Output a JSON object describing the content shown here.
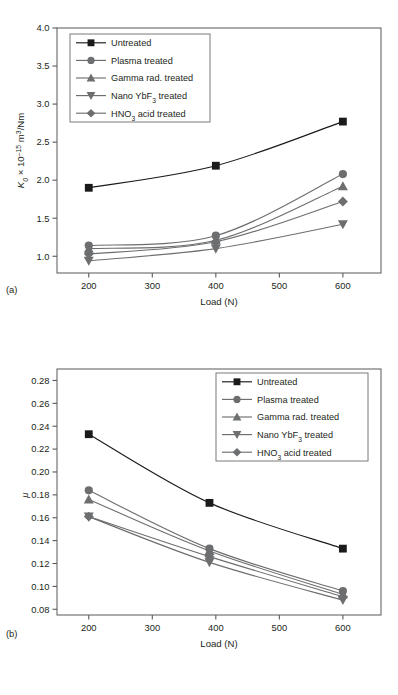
{
  "figure": {
    "panels": [
      {
        "letter": "(a)"
      },
      {
        "letter": "(b)"
      }
    ]
  },
  "legend": {
    "entries": [
      {
        "label": "Untreated",
        "marker": "square",
        "color": "#1a1a1a"
      },
      {
        "label": "Plasma treated",
        "marker": "circle",
        "color": "#6d6e70"
      },
      {
        "label": "Gamma rad. treated",
        "marker": "triangle-up",
        "color": "#6d6e70"
      },
      {
        "label": "Nano YbF3 treated",
        "marker": "triangle-down",
        "color": "#6d6e70"
      },
      {
        "label": "HNO3 acid treated",
        "marker": "diamond",
        "color": "#6d6e70"
      }
    ]
  },
  "chart_data": [
    {
      "type": "line",
      "panel": "(a)",
      "title": "",
      "xlabel": "Load (N)",
      "ylabel": "K0 × 10⁻¹⁵ m³/Nm",
      "x": [
        200,
        400,
        600
      ],
      "xlim": [
        150,
        660
      ],
      "ylim": [
        0.78,
        4.0
      ],
      "xticks": [
        200,
        300,
        400,
        500,
        600
      ],
      "xticklabels": [
        "200",
        "300",
        "400",
        "500",
        "600"
      ],
      "yticks": [
        1.0,
        1.5,
        2.0,
        2.5,
        3.0,
        3.5,
        4.0
      ],
      "yticklabels": [
        "1.0",
        "1.5",
        "2.0",
        "2.5",
        "3.0",
        "3.5",
        "4.0"
      ],
      "grid": false,
      "legend_position": "upper-left",
      "series": [
        {
          "name": "Untreated",
          "values": [
            1.9,
            2.19,
            2.77
          ],
          "marker": "square",
          "color": "#1a1a1a"
        },
        {
          "name": "Plasma treated",
          "values": [
            1.14,
            1.27,
            2.08
          ],
          "marker": "circle",
          "color": "#6d6e70"
        },
        {
          "name": "Gamma rad. treated",
          "values": [
            1.1,
            1.21,
            1.92
          ],
          "marker": "triangle-up",
          "color": "#6d6e70"
        },
        {
          "name": "Nano YbF3 treated",
          "values": [
            0.94,
            1.1,
            1.42
          ],
          "marker": "triangle-down",
          "color": "#6d6e70"
        },
        {
          "name": "HNO3 acid treated",
          "values": [
            1.03,
            1.19,
            1.72
          ],
          "marker": "diamond",
          "color": "#6d6e70"
        }
      ]
    },
    {
      "type": "line",
      "panel": "(b)",
      "title": "",
      "xlabel": "Load (N)",
      "ylabel": "μ",
      "x": [
        200,
        390,
        600
      ],
      "xlim": [
        150,
        660
      ],
      "ylim": [
        0.075,
        0.29
      ],
      "xticks": [
        200,
        300,
        400,
        500,
        600
      ],
      "xticklabels": [
        "200",
        "300",
        "400",
        "500",
        "600"
      ],
      "yticks": [
        0.08,
        0.1,
        0.12,
        0.14,
        0.16,
        0.18,
        0.2,
        0.22,
        0.24,
        0.26,
        0.28
      ],
      "yticklabels": [
        "0.08",
        "0.10",
        "0.12",
        "0.14",
        "0.16",
        "0.18",
        "0.20",
        "0.22",
        "0.24",
        "0.26",
        "0.28"
      ],
      "grid": false,
      "legend_position": "upper-right",
      "series": [
        {
          "name": "Untreated",
          "values": [
            0.233,
            0.173,
            0.133
          ],
          "marker": "square",
          "color": "#1a1a1a"
        },
        {
          "name": "Plasma treated",
          "values": [
            0.184,
            0.133,
            0.096
          ],
          "marker": "circle",
          "color": "#6d6e70"
        },
        {
          "name": "Gamma rad. treated",
          "values": [
            0.176,
            0.131,
            0.093
          ],
          "marker": "triangle-up",
          "color": "#6d6e70"
        },
        {
          "name": "Nano YbF3 treated",
          "values": [
            0.161,
            0.121,
            0.088
          ],
          "marker": "triangle-down",
          "color": "#6d6e70"
        },
        {
          "name": "HNO3 acid treated",
          "values": [
            0.161,
            0.126,
            0.091
          ],
          "marker": "diamond",
          "color": "#6d6e70"
        }
      ]
    }
  ]
}
